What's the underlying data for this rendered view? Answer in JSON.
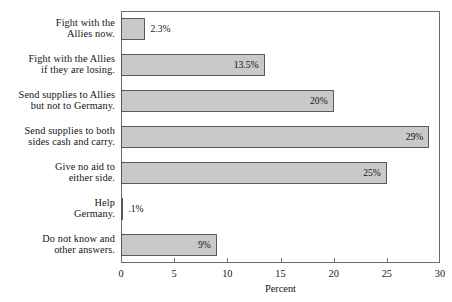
{
  "chart_data": {
    "type": "bar",
    "orientation": "horizontal",
    "title": "",
    "subtitle": "",
    "xlabel": "Percent",
    "ylabel": "",
    "xlim": [
      0,
      30
    ],
    "xticks": [
      0,
      5,
      10,
      15,
      20,
      25,
      30
    ],
    "xtick_labels": [
      "0",
      "5",
      "10",
      "15",
      "20",
      "25",
      "30"
    ],
    "grid": false,
    "legend": false,
    "categories": [
      "Fight with the\nAllies now.",
      "Fight with the Allies\nif they are losing.",
      "Send supplies to Allies\nbut not to Germany.",
      "Send supplies to both\nsides cash and carry.",
      "Give no aid to\neither side.",
      "Help\nGermany.",
      "Do not know and\nother answers."
    ],
    "category_lines": [
      [
        "Fight with the",
        "Allies now."
      ],
      [
        "Fight with the Allies",
        "if they are losing."
      ],
      [
        "Send supplies to Allies",
        "but not to Germany."
      ],
      [
        "Send supplies to both",
        "sides cash and carry."
      ],
      [
        "Give no aid to",
        "either side."
      ],
      [
        "Help",
        "Germany."
      ],
      [
        "Do not know and",
        "other answers."
      ]
    ],
    "values": [
      2.3,
      13.5,
      20,
      29,
      25,
      0.1,
      9
    ],
    "value_labels": [
      "2.3%",
      "13.5%",
      "20%",
      "29%",
      "25%",
      ".1%",
      "9%"
    ],
    "label_placement": [
      "outside",
      "inside",
      "inside",
      "inside",
      "inside",
      "outside",
      "inside"
    ],
    "bar_fill_color": "#c9c9c9",
    "bar_border_color": "#5a5a5a",
    "axis_color": "#6b6b6b",
    "text_color": "#141414",
    "background_color": "#ffffff"
  }
}
